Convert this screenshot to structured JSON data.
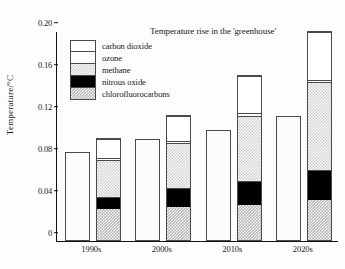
{
  "chart_data": {
    "type": "bar",
    "title": "Temperature rise in the 'greenhouse'",
    "xlabel": "",
    "ylabel": "Temperature/°C",
    "ylim": [
      0,
      0.2
    ],
    "yticks": [
      "0",
      "0.04",
      "0.08",
      "0.12",
      "0.16",
      "0.20"
    ],
    "ytick_values": [
      0,
      0.04,
      0.08,
      0.12,
      0.16,
      0.2
    ],
    "grid": false,
    "legend_position": "upper-left-inside",
    "categories": [
      "1990s",
      "2000s",
      "2010s",
      "2020s"
    ],
    "totals": {
      "name": "total temperature rise",
      "values": [
        0.085,
        0.097,
        0.106,
        0.119
      ]
    },
    "series": [
      {
        "name": "chlorofluorocarbons",
        "values": [
          0.03,
          0.032,
          0.034,
          0.038
        ]
      },
      {
        "name": "nitrous oxide",
        "values": [
          0.012,
          0.018,
          0.023,
          0.029
        ]
      },
      {
        "name": "methane",
        "values": [
          0.036,
          0.044,
          0.063,
          0.085
        ]
      },
      {
        "name": "ozone",
        "values": [
          0.002,
          0.002,
          0.002,
          0.002
        ]
      },
      {
        "name": "carbon dioxide",
        "values": [
          0.018,
          0.024,
          0.036,
          0.046
        ]
      }
    ],
    "stacked_totals": [
      0.098,
      0.12,
      0.158,
      0.2
    ]
  },
  "legend": {
    "items": [
      {
        "label": "carbon dioxide",
        "key": "co2"
      },
      {
        "label": "ozone",
        "key": "ozone"
      },
      {
        "label": "methane",
        "key": "methane"
      },
      {
        "label": "nitrous oxide",
        "key": "n2o"
      },
      {
        "label": "chlorofluorocarbons",
        "key": "cfc"
      }
    ]
  }
}
